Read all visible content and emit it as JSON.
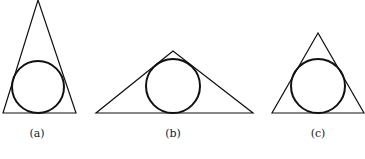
{
  "figures": [
    {
      "id": "a",
      "label": "(a)",
      "triangle": [
        [
          38,
          0
        ],
        [
          3,
          113
        ],
        [
          76,
          113
        ]
      ],
      "circle": {
        "cx": 38,
        "cy": 87,
        "r": 26
      },
      "label_pos": {
        "x": 37,
        "y": 127
      }
    },
    {
      "id": "b",
      "label": "(b)",
      "triangle": [
        [
          173,
          51
        ],
        [
          96,
          113
        ],
        [
          253,
          113
        ]
      ],
      "circle": {
        "cx": 173,
        "cy": 86,
        "r": 27
      },
      "label_pos": {
        "x": 173,
        "y": 127
      }
    },
    {
      "id": "c",
      "label": "(c)",
      "triangle": [
        [
          318,
          33
        ],
        [
          272,
          113
        ],
        [
          364,
          113
        ]
      ],
      "circle": {
        "cx": 318,
        "cy": 86,
        "r": 27
      },
      "label_pos": {
        "x": 318,
        "y": 127
      }
    }
  ],
  "style": {
    "stroke": "#111111",
    "triangle_width": 1.2,
    "circle_width": 2
  }
}
